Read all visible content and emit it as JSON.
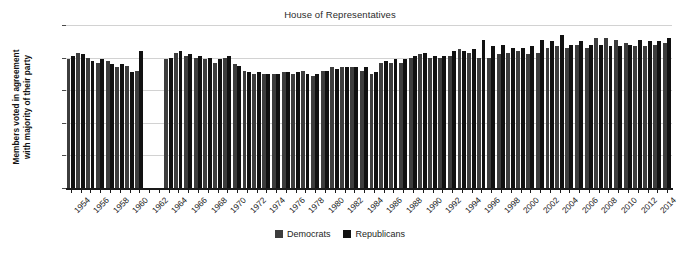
{
  "chart_data": {
    "type": "bar",
    "title": "House of Representatives",
    "xlabel": "",
    "ylabel": "Members voted in agreement with majority of their party",
    "ylabel_line1": "Members voted in agreement",
    "ylabel_line2": "with majority of their party",
    "ylim": [
      0,
      100
    ],
    "yticks": [
      0,
      20,
      40,
      60,
      80,
      100
    ],
    "ytick_labels": [
      "0%",
      "20%",
      "40%",
      "60%",
      "80%",
      "100%"
    ],
    "grid": true,
    "legend_position": "bottom-center",
    "x": [
      1953,
      1954,
      1955,
      1956,
      1957,
      1958,
      1959,
      1960,
      1961,
      1962,
      1963,
      1964,
      1965,
      1966,
      1967,
      1968,
      1969,
      1970,
      1971,
      1972,
      1973,
      1974,
      1975,
      1976,
      1977,
      1978,
      1979,
      1980,
      1981,
      1982,
      1983,
      1984,
      1985,
      1986,
      1987,
      1988,
      1989,
      1990,
      1991,
      1992,
      1993,
      1994,
      1995,
      1996,
      1997,
      1998,
      1999,
      2000,
      2001,
      2002,
      2003,
      2004,
      2005,
      2006,
      2007,
      2008,
      2009,
      2010,
      2011,
      2012,
      2013,
      2014
    ],
    "xtick_labels": [
      "1954",
      "1956",
      "1958",
      "1960",
      "1962",
      "1964",
      "1966",
      "1968",
      "1970",
      "1972",
      "1974",
      "1976",
      "1978",
      "1980",
      "1982",
      "1984",
      "1986",
      "1988",
      "1990",
      "1992",
      "1994",
      "1996",
      "1998",
      "2000",
      "2002",
      "2004",
      "2006",
      "2008",
      "2010",
      "2012",
      "2014"
    ],
    "series": [
      {
        "name": "Democrats",
        "color": "#3d3d3d",
        "values": [
          79,
          83,
          80,
          77,
          78,
          74,
          75,
          72,
          null,
          null,
          79,
          83,
          81,
          80,
          79,
          77,
          80,
          76,
          72,
          70,
          70,
          70,
          71,
          70,
          72,
          69,
          72,
          74,
          74,
          74,
          72,
          70,
          77,
          77,
          77,
          80,
          82,
          80,
          80,
          81,
          85,
          83,
          80,
          80,
          82,
          83,
          84,
          82,
          83,
          86,
          87,
          86,
          88,
          86,
          92,
          92,
          91,
          89,
          87,
          87,
          88,
          89
        ],
        "note": "Percent of Democratic members voting with party majority"
      },
      {
        "name": "Republicans",
        "color": "#111111",
        "values": [
          81,
          82,
          78,
          79,
          76,
          76,
          71,
          84,
          null,
          null,
          80,
          84,
          82,
          81,
          80,
          79,
          81,
          75,
          71,
          71,
          70,
          70,
          71,
          71,
          70,
          70,
          72,
          73,
          74,
          74,
          74,
          71,
          78,
          79,
          79,
          81,
          83,
          81,
          81,
          84,
          84,
          85,
          91,
          87,
          88,
          86,
          86,
          87,
          91,
          90,
          94,
          88,
          90,
          88,
          88,
          87,
          87,
          88,
          91,
          90,
          90,
          92
        ],
        "note": "Percent of Republican members voting with party majority"
      }
    ]
  },
  "legend": {
    "items": [
      {
        "label": "Democrats",
        "swatch_class": "dem"
      },
      {
        "label": "Republicans",
        "swatch_class": "rep"
      }
    ]
  },
  "colors": {
    "democrats": "#3d3d3d",
    "republicans": "#111111",
    "gridline": "#d2d2d2",
    "axis": "#1a1a1a",
    "background": "#ffffff"
  }
}
